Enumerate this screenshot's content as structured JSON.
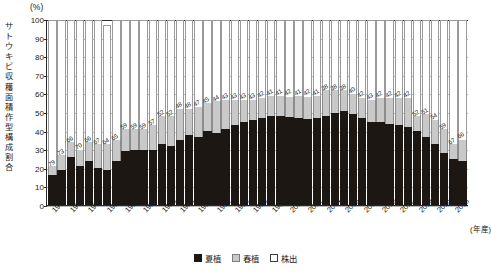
{
  "chart_data": {
    "type": "bar",
    "stacked": true,
    "stack_mode": "percent",
    "title": "",
    "unit_label": "(%)",
    "ylabel": "サトウキビ収穫面積作型構成割合",
    "xlabel": "(年産)",
    "ylim": [
      0,
      100
    ],
    "ytick_step": 10,
    "yticks": [
      "0",
      "10",
      "20",
      "30",
      "40",
      "50",
      "60",
      "70",
      "80",
      "90",
      "100"
    ],
    "grid": true,
    "legend_position": "bottom-center",
    "categories": [
      "1974",
      "1975",
      "1976",
      "1977",
      "1978",
      "1979",
      "1980",
      "1981",
      "1982",
      "1983",
      "1984",
      "1985",
      "1986",
      "1987",
      "1988",
      "1989",
      "1990",
      "1991",
      "1992",
      "1993",
      "1994",
      "1995",
      "1996",
      "1997",
      "1998",
      "1999",
      "2000",
      "2001",
      "2002",
      "2003",
      "2004",
      "2005",
      "2006",
      "2007",
      "2008",
      "2009",
      "2010",
      "2011",
      "2012",
      "2013",
      "2014",
      "2015",
      "2016",
      "2017",
      "2018",
      "2019"
    ],
    "xtick_labels": [
      "1974",
      "1976",
      "1978",
      "1980",
      "1982",
      "1984",
      "1986",
      "1988",
      "1990",
      "1992",
      "1994",
      "1996",
      "1998",
      "2000",
      "2002",
      "2004",
      "2006",
      "2008",
      "2010",
      "2012",
      "2014",
      "2016",
      "2018"
    ],
    "series": [
      {
        "name": "夏植",
        "color": "#1d1714",
        "values": [
          16,
          19,
          26,
          21,
          24,
          20,
          19,
          24,
          29,
          30,
          30,
          30,
          33,
          32,
          35,
          38,
          37,
          40,
          39,
          41,
          43,
          45,
          46,
          47,
          48,
          48,
          48,
          47,
          47,
          47,
          48,
          50,
          51,
          49,
          47,
          45,
          45,
          44,
          43,
          42,
          40,
          37,
          33,
          28,
          25,
          24
        ]
      },
      {
        "name": "春植",
        "color": "#c9c9c9",
        "values": [
          5,
          8,
          8,
          9,
          10,
          13,
          14,
          11,
          12,
          11,
          11,
          13,
          15,
          16,
          17,
          14,
          16,
          15,
          17,
          16,
          14,
          12,
          11,
          11,
          11,
          11,
          11,
          12,
          12,
          12,
          14,
          12,
          11,
          11,
          11,
          12,
          13,
          14,
          15,
          16,
          8,
          12,
          13,
          13,
          8,
          12
        ]
      },
      {
        "name": "株出",
        "color": "#ffffff",
        "values": [
          79,
          73,
          66,
          70,
          66,
          67,
          64,
          65,
          59,
          59,
          59,
          57,
          52,
          52,
          48,
          48,
          47,
          45,
          44,
          43,
          43,
          43,
          43,
          42,
          41,
          41,
          42,
          41,
          42,
          41,
          38,
          38,
          38,
          40,
          42,
          43,
          42,
          42,
          42,
          42,
          52,
          51,
          54,
          59,
          67,
          66
        ]
      }
    ],
    "data_labels_series": "株出",
    "data_labels": [
      "79",
      "73",
      "66",
      "70",
      "66",
      "67",
      "64",
      "65",
      "59",
      "59",
      "59",
      "57",
      "52",
      "52",
      "48",
      "48",
      "47",
      "45",
      "44",
      "43",
      "43",
      "43",
      "43",
      "42",
      "41",
      "41",
      "42",
      "41",
      "42",
      "41",
      "38",
      "38",
      "38",
      "40",
      "42",
      "43",
      "42",
      "42",
      "42",
      "42",
      "52",
      "51",
      "54",
      "59",
      "67",
      "66"
    ]
  },
  "legend": {
    "items": [
      {
        "label": "夏植",
        "color": "#1d1714"
      },
      {
        "label": "春植",
        "color": "#c9c9c9"
      },
      {
        "label": "株出",
        "color": "#ffffff"
      }
    ]
  },
  "axis": {
    "y_title_chars": [
      "サ",
      "ト",
      "ウ",
      "キ",
      "ビ",
      "収",
      "穫",
      "面",
      "積",
      "作",
      "型",
      "構",
      "成",
      "割",
      "合"
    ],
    "unit": "(%)",
    "x_unit": "(年産)"
  }
}
